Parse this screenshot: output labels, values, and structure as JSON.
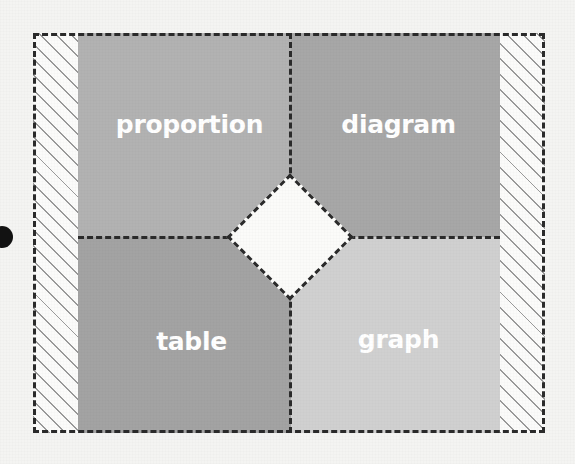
{
  "figure": {
    "background_color": "#f4f4f2",
    "frame": {
      "style": "dashed",
      "color": "#2a2a2a"
    },
    "quadrants": [
      {
        "id": "proportion",
        "label": "proportion",
        "position": "top-left",
        "fill_color": "#b2b2b2",
        "label_color": "#ffffff"
      },
      {
        "id": "diagram",
        "label": "diagram",
        "position": "top-right",
        "fill_color": "#a7a7a7",
        "label_color": "#ffffff"
      },
      {
        "id": "table",
        "label": "table",
        "position": "bottom-left",
        "fill_color": "#a3a3a3",
        "label_color": "#ffffff"
      },
      {
        "id": "graph",
        "label": "graph",
        "position": "bottom-right",
        "fill_color": "#d0d0d0",
        "label_color": "#ffffff"
      }
    ],
    "center_region": {
      "shape": "diamond",
      "fill_color": "#fbfbf9",
      "border_style": "dashed",
      "label": ""
    },
    "side_bands": {
      "pattern": "diagonal-hatch",
      "hatch_color": "#9a9a9a",
      "background_color": "#fbfbfa",
      "sides": [
        "left",
        "right"
      ]
    },
    "marks": {
      "ink_dot_color": "#121212"
    }
  }
}
